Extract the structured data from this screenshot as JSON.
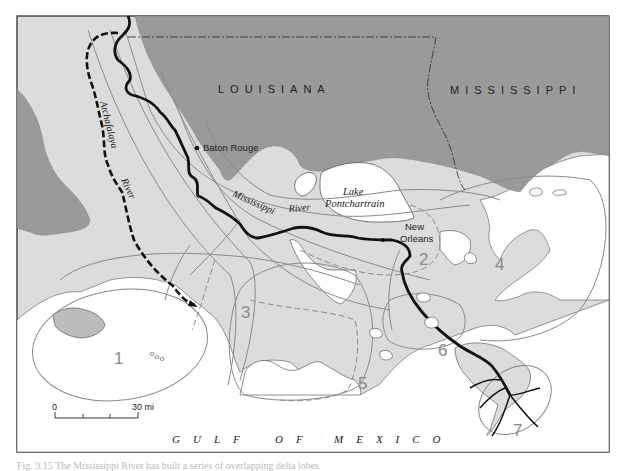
{
  "map": {
    "states": [
      {
        "name": "LOUISIANA"
      },
      {
        "name": "MISSISSIPPI"
      }
    ],
    "cities": [
      {
        "name": "Baton Rouge"
      },
      {
        "name_line1": "New",
        "name_line2": "Orleans"
      }
    ],
    "rivers": [
      {
        "name_part1": "Atchafalaya",
        "name_part2": "River"
      },
      {
        "name_part1": "Mississippi",
        "name_part2": "River"
      }
    ],
    "lakes": [
      {
        "name_line1": "Lake",
        "name_line2": "Pontchartrain"
      }
    ],
    "water_body": "G U L F   O F   M E X I C O",
    "water_body_words": [
      "GULF",
      "OF",
      "MEXICO"
    ],
    "delta_lobes": [
      "1",
      "2",
      "3",
      "4",
      "5",
      "6",
      "7"
    ],
    "scale_bar": {
      "start": "0",
      "end": "30 mi"
    },
    "colors": {
      "upland": "#9a9a9a",
      "deltaic_plain": "#dcdcdc",
      "water": "#ffffff",
      "river": "#111111",
      "lobe_outline": "#8a8a8a",
      "frame": "#333333"
    }
  },
  "caption": "Fig. 9.15  The Mississippi River has built a series of overlapping delta lobes"
}
